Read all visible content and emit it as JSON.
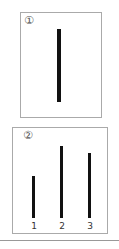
{
  "panels": [
    {
      "id": "panel-1",
      "number": "①",
      "bars": [
        {
          "height_px": 73
        }
      ]
    },
    {
      "id": "panel-2",
      "number": "②",
      "bars": [
        {
          "label": "1",
          "height_px": 42
        },
        {
          "label": "2",
          "height_px": 72
        },
        {
          "label": "3",
          "height_px": 65
        }
      ]
    }
  ],
  "colors": {
    "bar": "#111111",
    "border": "#aaaaaa",
    "divider": "#999999"
  }
}
